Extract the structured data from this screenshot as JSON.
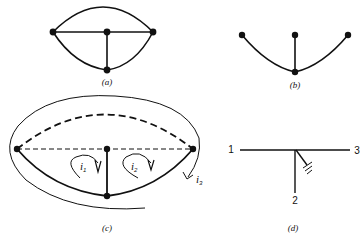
{
  "figure": {
    "panels": [
      {
        "id": "a",
        "caption": "(a)",
        "description": "Graph with 4 nodes: left, center, right on horizontal line, bottom node; top arc connects left and right; lower arcs connect left/right to bottom; vertical edge center-bottom"
      },
      {
        "id": "b",
        "caption": "(b)",
        "description": "Tree: three top nodes connected to one bottom node"
      },
      {
        "id": "c",
        "caption": "(c)",
        "description": "Graph with tree branches solid, links dashed, and loop currents",
        "currents": [
          {
            "symbol": "i",
            "subscript": "1"
          },
          {
            "symbol": "i",
            "subscript": "2"
          },
          {
            "symbol": "i",
            "subscript": "3"
          }
        ]
      },
      {
        "id": "d",
        "caption": "(d)",
        "description": "Three-terminal element with terminals 1, 2, 3 and ground",
        "terminals": [
          "1",
          "2",
          "3"
        ]
      }
    ]
  },
  "colors": {
    "stroke": "#111111",
    "background": "#ffffff"
  }
}
